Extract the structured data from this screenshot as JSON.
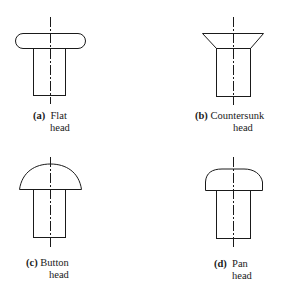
{
  "diagram": {
    "type": "rivet head types",
    "panels": [
      {
        "id": "a",
        "tag": "(a)",
        "name": "Flat",
        "suffix": "head",
        "shape": "flat-head"
      },
      {
        "id": "b",
        "tag": "(b)",
        "name": "Countersunk",
        "suffix": "head",
        "shape": "countersunk-head"
      },
      {
        "id": "c",
        "tag": "(c)",
        "name": "Button",
        "suffix": "head",
        "shape": "button-head"
      },
      {
        "id": "d",
        "tag": "(d)",
        "name": "Pan",
        "suffix": "head",
        "shape": "pan-head"
      }
    ],
    "line_color": "#1a1a1a"
  }
}
